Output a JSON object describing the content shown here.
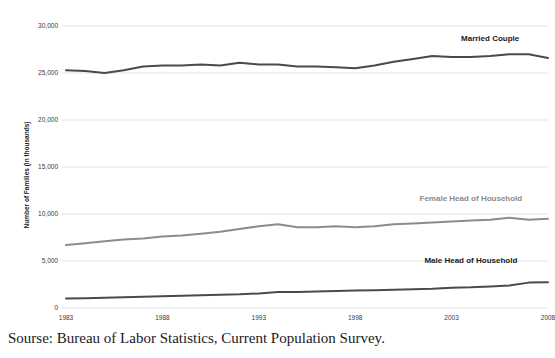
{
  "source_caption": "Sourse: Bureau of Labor Statistics, Current Population Survey.",
  "axis": {
    "y_title": "Number of Families (in thousands)"
  },
  "labels": {
    "married": "Married Couple",
    "female": "Female Head of Household",
    "male": "Male Head of Household"
  },
  "colors": {
    "married_line": "#4a4a4a",
    "female_line": "#8c8c8c",
    "male_line": "#4a4a4a",
    "married_label": "#1a1a1a",
    "female_label": "#8c8c8c",
    "male_label": "#1a1a1a",
    "gridline": "#e3e3e3",
    "axis_text": "#3a3a3a"
  },
  "chart_data": {
    "type": "line",
    "title": "",
    "xlabel": "",
    "ylabel": "Number of Families (in thousands)",
    "xlim": [
      1983,
      2008
    ],
    "ylim": [
      0,
      30000
    ],
    "grid": true,
    "legend": "inline-annotations",
    "yticks": [
      0,
      5000,
      10000,
      15000,
      20000,
      25000,
      30000
    ],
    "ytick_labels": [
      "0",
      "5,000",
      "10,000",
      "15,000",
      "20,000",
      "25,000",
      "30,000"
    ],
    "xticks": [
      1983,
      1988,
      1993,
      1998,
      2003,
      2008
    ],
    "xtick_labels": [
      "1983",
      "1988",
      "1993",
      "1998",
      "2003",
      "2008"
    ],
    "x": [
      1983,
      1984,
      1985,
      1986,
      1987,
      1988,
      1989,
      1990,
      1991,
      1992,
      1993,
      1994,
      1995,
      1996,
      1997,
      1998,
      1999,
      2000,
      2001,
      2002,
      2003,
      2004,
      2005,
      2006,
      2007,
      2008
    ],
    "series": [
      {
        "name": "Married Couple",
        "color": "#4a4a4a",
        "values": [
          25300,
          25200,
          25000,
          25300,
          25700,
          25800,
          25800,
          25900,
          25800,
          26100,
          25900,
          25900,
          25700,
          25700,
          25600,
          25500,
          25800,
          26200,
          26500,
          26800,
          26700,
          26700,
          26800,
          27000,
          27000,
          26600
        ]
      },
      {
        "name": "Female Head of Household",
        "color": "#8c8c8c",
        "values": [
          6700,
          6900,
          7100,
          7300,
          7400,
          7600,
          7700,
          7900,
          8100,
          8400,
          8700,
          8900,
          8600,
          8600,
          8700,
          8600,
          8700,
          8900,
          9000,
          9100,
          9200,
          9300,
          9400,
          9600,
          9400,
          9500
        ]
      },
      {
        "name": "Male Head of Household",
        "color": "#4a4a4a",
        "values": [
          1000,
          1050,
          1100,
          1150,
          1200,
          1250,
          1300,
          1350,
          1400,
          1450,
          1550,
          1700,
          1700,
          1750,
          1800,
          1850,
          1900,
          1950,
          2000,
          2050,
          2150,
          2200,
          2300,
          2400,
          2700,
          2750
        ]
      }
    ],
    "annotations": [
      {
        "text": "Married Couple",
        "x": 2005,
        "y": 28400
      },
      {
        "text": "Female Head of Household",
        "x": 2004,
        "y": 11400
      },
      {
        "text": "Male Head of Household",
        "x": 2004,
        "y": 4800
      }
    ]
  }
}
